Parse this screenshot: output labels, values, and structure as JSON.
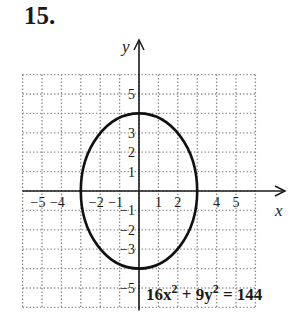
{
  "problem": {
    "number": "15."
  },
  "chart_data": {
    "type": "line",
    "title": "",
    "equation": {
      "lhs_a": "16x",
      "exp1": "2",
      "plus": " + 9y",
      "exp2": "2",
      "rhs": " = 144"
    },
    "xlabel": "x",
    "ylabel": "y",
    "xlim": [
      -6,
      6
    ],
    "ylim": [
      -6,
      6
    ],
    "grid": true,
    "x_ticks": [
      "-5",
      "-4",
      "-2",
      "-1",
      "1",
      "2",
      "4",
      "5"
    ],
    "x_tick_values": [
      -5,
      -4,
      -2,
      -1,
      1,
      2,
      4,
      5
    ],
    "y_ticks": [
      "5",
      "3",
      "2",
      "1",
      "-1",
      "-2",
      "-3",
      "-5"
    ],
    "y_tick_values": [
      5,
      3,
      2,
      1,
      -1,
      -2,
      -3,
      -5
    ],
    "series": [
      {
        "name": "ellipse 16x^2 + 9y^2 = 144",
        "shape": "ellipse",
        "center": [
          0,
          0
        ],
        "semi_axis_x": 3,
        "semi_axis_y": 4,
        "key_points": [
          [
            3,
            0
          ],
          [
            -3,
            0
          ],
          [
            0,
            4
          ],
          [
            0,
            -4
          ]
        ]
      }
    ],
    "colors": {
      "curve": "#111111",
      "grid": "#8a8a8a",
      "axes": "#1a1a1a"
    }
  }
}
